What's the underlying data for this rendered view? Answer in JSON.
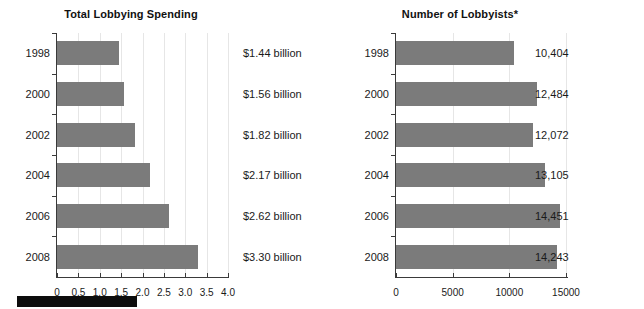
{
  "chart_data": [
    {
      "type": "bar",
      "orientation": "horizontal",
      "title": "Total Lobbying Spending",
      "xlabel": "",
      "ylabel": "",
      "categories": [
        "1998",
        "2000",
        "2002",
        "2004",
        "2006",
        "2008"
      ],
      "values": [
        1.44,
        1.56,
        1.82,
        2.17,
        2.62,
        3.3
      ],
      "value_labels": [
        "$1.44 billion",
        "$1.56 billion",
        "$1.82 billion",
        "$2.17 billion",
        "$2.62 billion",
        "$3.30 billion"
      ],
      "xlim": [
        0,
        4.0
      ],
      "xticks": [
        0,
        0.5,
        1.0,
        1.5,
        2.0,
        2.5,
        3.0,
        3.5,
        4.0
      ],
      "xtick_labels": [
        "0",
        "0.5",
        "1.0",
        "1.5",
        "2.0",
        "2.5",
        "3.0",
        "3.5",
        "4.0"
      ],
      "grid": true,
      "legend": "none",
      "bar_color": "#7b7b7b"
    },
    {
      "type": "bar",
      "orientation": "horizontal",
      "title": "Number of Lobbyists*",
      "xlabel": "",
      "ylabel": "",
      "categories": [
        "1998",
        "2000",
        "2002",
        "2004",
        "2006",
        "2008"
      ],
      "values": [
        10404,
        12484,
        12072,
        13105,
        14451,
        14243
      ],
      "value_labels": [
        "10,404",
        "12,484",
        "12,072",
        "13,105",
        "14,451",
        "14,243"
      ],
      "xlim": [
        0,
        15000
      ],
      "xticks": [
        0,
        5000,
        10000,
        15000
      ],
      "xtick_labels": [
        "0",
        "5000",
        "10000",
        "15000"
      ],
      "grid": true,
      "legend": "none",
      "bar_color": "#7b7b7b"
    }
  ],
  "footer": {
    "redaction_label": ""
  }
}
